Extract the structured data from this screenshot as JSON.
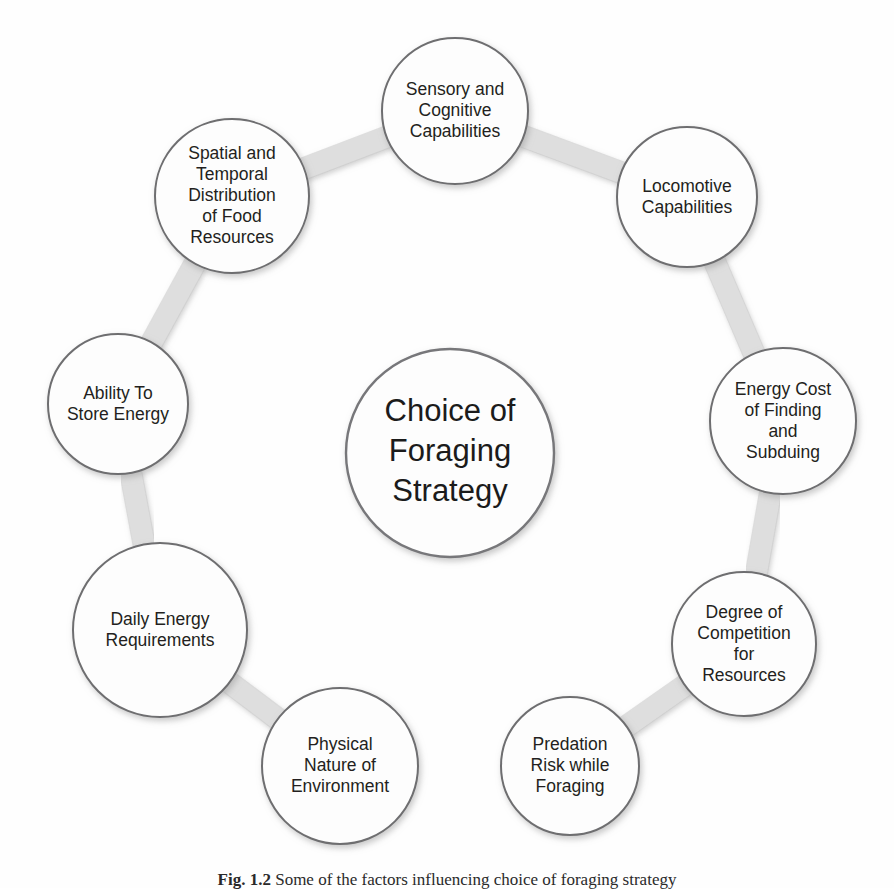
{
  "figure": {
    "center": {
      "lines": [
        "Choice of",
        "Foraging",
        "Strategy"
      ],
      "full_text": "Choice of Foraging Strategy"
    },
    "nodes": [
      {
        "id": "sensory-and-cognitive-capabilities",
        "full_text": "Sensory and Cognitive Capabilities",
        "lines": [
          "Sensory and",
          "Cognitive",
          "Capabilities"
        ],
        "cx": 455,
        "cy": 111,
        "r": 73
      },
      {
        "id": "locomotive-capabilities",
        "full_text": "Locomotive Capabilities",
        "lines": [
          "Locomotive",
          "Capabilities"
        ],
        "cx": 687,
        "cy": 197,
        "r": 70
      },
      {
        "id": "energy-cost-of-finding-and-subduing",
        "full_text": "Energy Cost of Finding and Subduing",
        "lines": [
          "Energy Cost",
          "of Finding",
          "and",
          "Subduing"
        ],
        "cx": 783,
        "cy": 421,
        "r": 73
      },
      {
        "id": "degree-of-competition-for-resources",
        "full_text": "Degree of Competition for Resources",
        "lines": [
          "Degree of",
          "Competition",
          "for",
          "Resources"
        ],
        "cx": 744,
        "cy": 644,
        "r": 72
      },
      {
        "id": "predation-risk-while-foraging",
        "full_text": "Predation Risk while Foraging",
        "lines": [
          "Predation",
          "Risk while",
          "Foraging"
        ],
        "cx": 570,
        "cy": 766,
        "r": 69
      },
      {
        "id": "physical-nature-of-environment",
        "full_text": "Physical Nature of Environment",
        "lines": [
          "Physical",
          "Nature of",
          "Environment"
        ],
        "cx": 340,
        "cy": 766,
        "r": 78
      },
      {
        "id": "daily-energy-requirements",
        "full_text": "Daily Energy Requirements",
        "lines": [
          "Daily Energy",
          "Requirements"
        ],
        "cx": 160,
        "cy": 630,
        "r": 87
      },
      {
        "id": "ability-to-store-energy",
        "full_text": "Ability To Store Energy",
        "lines": [
          "Ability To",
          "Store Energy"
        ],
        "cx": 118,
        "cy": 404,
        "r": 70
      },
      {
        "id": "spatial-and-temporal-distribution-of-food-resources",
        "full_text": "Spatial and Temporal Distribution of Food Resources",
        "lines": [
          "Spatial and",
          "Temporal",
          "Distribution",
          "of Food",
          "Resources"
        ],
        "cx": 232,
        "cy": 196,
        "r": 77
      }
    ],
    "connectors": [
      {
        "from": "sensory-and-cognitive-capabilities",
        "to": "locomotive-capabilities"
      },
      {
        "from": "locomotive-capabilities",
        "to": "energy-cost-of-finding-and-subduing"
      },
      {
        "from": "energy-cost-of-finding-and-subduing",
        "to": "degree-of-competition-for-resources"
      },
      {
        "from": "degree-of-competition-for-resources",
        "to": "predation-risk-while-foraging"
      },
      {
        "from": "predation-risk-while-foraging",
        "to": "physical-nature-of-environment"
      },
      {
        "from": "physical-nature-of-environment",
        "to": "daily-energy-requirements"
      },
      {
        "from": "daily-energy-requirements",
        "to": "ability-to-store-energy"
      },
      {
        "from": "ability-to-store-energy",
        "to": "spatial-and-temporal-distribution-of-food-resources"
      },
      {
        "from": "spatial-and-temporal-distribution-of-food-resources",
        "to": "sensory-and-cognitive-capabilities"
      }
    ],
    "center_circle": {
      "cx": 450,
      "cy": 453,
      "r": 104
    },
    "caption": {
      "number": "Fig. 1.2",
      "text": "Some of the factors influencing choice of foraging strategy"
    },
    "colors": {
      "node_fill": "#fdfdfd",
      "node_stroke": "#6e6e70",
      "connector": "#dedede",
      "text": "#231f20",
      "background": "#ffffff"
    }
  }
}
